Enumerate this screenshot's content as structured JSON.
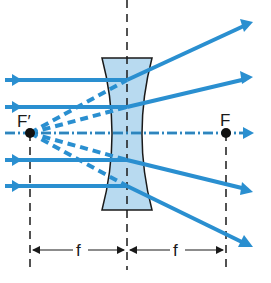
{
  "diagram": {
    "type": "diverging-lens-ray-diagram",
    "colors": {
      "ray": "#2a8fd0",
      "lens_fill": "#b8daf0",
      "lens_stroke": "#1a1a1a",
      "line": "#1a1a1a"
    },
    "labels": {
      "virtual_focus": "F′",
      "real_focus": "F",
      "focal_length_left": "f",
      "focal_length_right": "f"
    },
    "points": {
      "virtual_focus": {
        "x": 30,
        "y": 133
      },
      "real_focus": {
        "x": 226,
        "y": 133
      },
      "lens_center_x": 127,
      "axis_y": 133
    },
    "incoming_rays_y": [
      80,
      107,
      160,
      186
    ],
    "outgoing_ray_ends": [
      {
        "x": 253,
        "y": 22
      },
      {
        "x": 253,
        "y": 77
      },
      {
        "x": 253,
        "y": 192
      },
      {
        "x": 253,
        "y": 247
      }
    ],
    "dimension_line_y": 250
  }
}
